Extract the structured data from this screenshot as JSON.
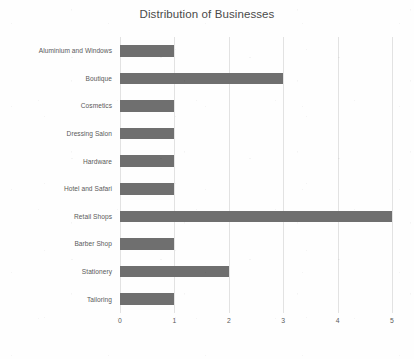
{
  "chart_data": {
    "type": "bar",
    "orientation": "horizontal",
    "title": "Distribution of Businesses",
    "xlabel": "",
    "ylabel": "",
    "categories": [
      "Aluminium and Windows",
      "Boutique",
      "Cosmetics",
      "Dressing Salon",
      "Hardware",
      "Hotel and Safari",
      "Retail Shops",
      "Barber Shop",
      "Stationery",
      "Tailoring"
    ],
    "values": [
      1,
      3,
      1,
      1,
      1,
      1,
      5,
      1,
      2,
      1
    ],
    "xticks": [
      "0",
      "1",
      "2",
      "3",
      "4",
      "5"
    ],
    "xtick_values": [
      0,
      1,
      2,
      3,
      4,
      5
    ],
    "xlim": [
      0,
      5
    ],
    "grid": "vertical",
    "legend": "none",
    "bar_color": "#6f6f6f",
    "gridline_color": "#e2e2e2",
    "title_color": "#4a4a4a",
    "label_color": "#5a5a5a",
    "background_color": "#fefefe"
  }
}
